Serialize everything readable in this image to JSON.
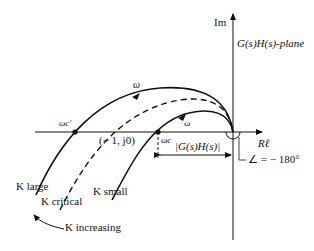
{
  "diagram": {
    "title": "G(s)H(s)-plane",
    "axes": {
      "imag_label": "Im",
      "real_label": "Rℓ"
    },
    "labels": {
      "omega_top": "ω",
      "omega_inner": "ω",
      "omega_c_prime": "ωc′",
      "minus_one": "(− 1, j0)",
      "omega_c": "ωc",
      "magnitude": "|G(s)H(s)|",
      "angle": "∠ = − 180°",
      "k_large": "K large",
      "k_critical": "K critical",
      "k_small": "K small",
      "k_increasing": "K increasing"
    },
    "curves": [
      {
        "name": "K large",
        "style": "solid"
      },
      {
        "name": "K critical",
        "style": "dashed"
      },
      {
        "name": "K small",
        "style": "solid"
      }
    ],
    "colors": {
      "ink": "#111111",
      "background": "#ffffff"
    }
  }
}
